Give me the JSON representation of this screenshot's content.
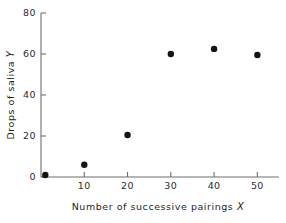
{
  "chart_data": {
    "type": "scatter",
    "title": "",
    "xlabel": "Number of successive pairings",
    "xlabel_var": "X",
    "ylabel": "Drops of saliva",
    "ylabel_var": "Y",
    "xlim": [
      0,
      55
    ],
    "ylim": [
      0,
      80
    ],
    "xticks": [
      10,
      20,
      30,
      40,
      50
    ],
    "yticks": [
      0,
      20,
      40,
      60,
      80
    ],
    "xtick_labels": [
      "10",
      "20",
      "30",
      "40",
      "50"
    ],
    "ytick_labels": [
      "0",
      "20",
      "40",
      "60",
      "80"
    ],
    "grid": false,
    "legend": false,
    "marker": "filled-circle",
    "marker_color": "#141414",
    "axis_color": "#6e6e6e",
    "background_color": "#ffffff",
    "x": [
      1,
      10,
      20,
      30,
      40,
      50
    ],
    "y": [
      1,
      6,
      20.5,
      60,
      62.5,
      59.5
    ],
    "points": [
      {
        "x": 1,
        "y": 1
      },
      {
        "x": 10,
        "y": 6
      },
      {
        "x": 20,
        "y": 20.5
      },
      {
        "x": 30,
        "y": 60
      },
      {
        "x": 40,
        "y": 62.5
      },
      {
        "x": 50,
        "y": 59.5
      }
    ]
  }
}
